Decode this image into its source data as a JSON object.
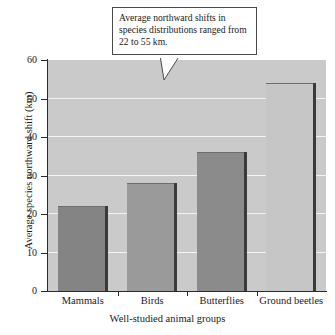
{
  "chart_data": {
    "type": "bar",
    "title": "",
    "categories": [
      "Mammals",
      "Birds",
      "Butterflies",
      "Ground beetles"
    ],
    "values": [
      22,
      28,
      36,
      54
    ],
    "xlabel": "Well-studied animal groups",
    "ylabel": "Average species northward shift (km)",
    "ylim": [
      0,
      60
    ],
    "yticks": [
      0,
      10,
      20,
      30,
      40,
      50,
      60
    ],
    "ytick_labels": [
      "0",
      "10",
      "20",
      "30",
      "40",
      "50",
      "60"
    ],
    "grid": "horizontal-only",
    "legend": "none",
    "annotation": "Average northward shifts in species distributions ranged from 22 to 55 km.",
    "bar_colors": [
      "#848484",
      "#9a9a9a",
      "#8b8b8b",
      "#c6c6c6"
    ],
    "plot_background": "#cacaca",
    "gridline_color": "#f4f4f4",
    "axis_color": "#2b2b2b",
    "shadow_color": "#3a3a3a"
  },
  "callout": {
    "text": "Average northward shifts in species distributions ranged from 22 to 55 km."
  }
}
